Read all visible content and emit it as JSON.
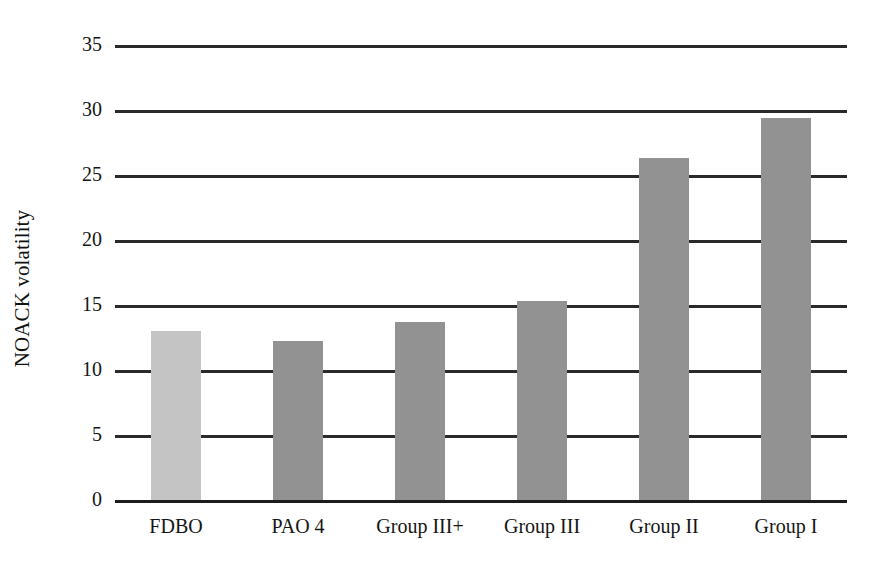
{
  "chart_data": {
    "type": "bar",
    "title": "",
    "xlabel": "",
    "ylabel": "NOACK volatility",
    "categories": [
      "FDBO",
      "PAO 4",
      "Group III+",
      "Group III",
      "Group II",
      "Group I"
    ],
    "values": [
      13.0,
      12.2,
      13.7,
      15.3,
      26.3,
      29.4
    ],
    "series": [
      {
        "name": "NOACK volatility",
        "values": [
          13.0,
          12.2,
          13.7,
          15.3,
          26.3,
          29.4
        ]
      }
    ],
    "ylim": [
      0,
      35
    ],
    "yticks": [
      0,
      5,
      10,
      15,
      20,
      25,
      30,
      35
    ],
    "ytick_labels": [
      "0",
      "5",
      "10",
      "15",
      "20",
      "25",
      "30",
      "35"
    ],
    "grid": true,
    "grid_axis": "y",
    "legend": false,
    "legend_position": "none",
    "bar_colors": [
      "#c4c4c4",
      "#929292",
      "#929292",
      "#929292",
      "#929292",
      "#929292"
    ],
    "gridline_color": "#2a2a2a",
    "background_color": "#ffffff"
  }
}
